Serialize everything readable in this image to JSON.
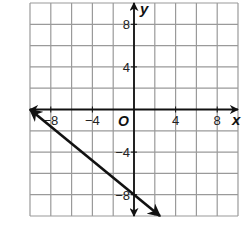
{
  "chart_data": {
    "type": "line",
    "title": "",
    "xlabel": "x",
    "ylabel": "y",
    "origin_label": "O",
    "xlim": [
      -10,
      10
    ],
    "ylim": [
      -10,
      10
    ],
    "grid": true,
    "grid_step": 2,
    "x_ticks": [
      -8,
      -4,
      4,
      8
    ],
    "y_ticks": [
      8,
      4,
      -4,
      -8
    ],
    "x_tick_labels": [
      "−8",
      "−4",
      "4",
      "8"
    ],
    "y_tick_labels": [
      "8",
      "4",
      "−4",
      "−8"
    ],
    "series": [
      {
        "name": "line",
        "equation": "y = -0.8x - 8",
        "points": [
          [
            -10,
            0
          ],
          [
            2.5,
            -10
          ]
        ],
        "arrows": "both",
        "color": "#111111"
      }
    ]
  },
  "colors": {
    "grid": "#9a9a9a",
    "axes": "#111111",
    "line": "#111111",
    "background": "#ffffff"
  }
}
